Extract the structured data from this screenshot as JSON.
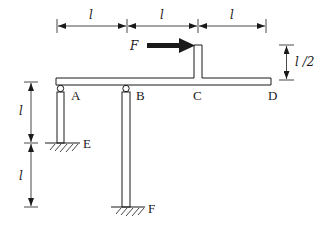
{
  "diagram": {
    "type": "structural-frame",
    "colors": {
      "ink": "#1a1a1a",
      "background": "#ffffff"
    },
    "top_dimensions": [
      {
        "label": "l",
        "from": "A",
        "to": "B"
      },
      {
        "label": "l",
        "from": "B",
        "to": "C"
      },
      {
        "label": "l",
        "from": "C",
        "to": "D"
      }
    ],
    "right_dimension": {
      "label": "l /2",
      "meaning": "height of post at C above beam"
    },
    "left_dimensions": [
      {
        "label": "l",
        "meaning": "height of column AE"
      },
      {
        "label": "l",
        "meaning": "extra length of column BF below E"
      }
    ],
    "force": {
      "label": "F",
      "direction": "right",
      "applied_at": "top of post at C"
    },
    "nodes": [
      {
        "label": "A",
        "support": "roller on column"
      },
      {
        "label": "B",
        "support": "roller on column"
      },
      {
        "label": "C",
        "support": "none"
      },
      {
        "label": "D",
        "support": "free end"
      },
      {
        "label": "E",
        "support": "fixed ground"
      },
      {
        "label": "F",
        "support": "fixed ground"
      }
    ]
  }
}
